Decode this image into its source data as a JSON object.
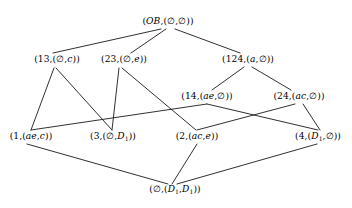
{
  "diagram": {
    "background_color": "#ffffff",
    "edge_color": "#1a1a1a",
    "text_color": "#000000",
    "width": 352,
    "height": 208,
    "nodes": [
      {
        "id": "OB",
        "label": "(OB,(∅,∅))",
        "x": 168,
        "y": 22,
        "level": 0
      },
      {
        "id": "13",
        "label": "(13,(∅,c))",
        "x": 57,
        "y": 60,
        "level": 1
      },
      {
        "id": "23",
        "label": "(23,(∅,e))",
        "x": 124,
        "y": 60,
        "level": 1
      },
      {
        "id": "124",
        "label": "(124,(a,∅))",
        "x": 248,
        "y": 60,
        "level": 1
      },
      {
        "id": "14",
        "label": "(14,(ae,∅))",
        "x": 207,
        "y": 97,
        "level": 2
      },
      {
        "id": "24",
        "label": "(24,(ac,∅))",
        "x": 299,
        "y": 97,
        "level": 2
      },
      {
        "id": "1",
        "label": "(1,(ae,c))",
        "x": 31,
        "y": 137,
        "level": 3
      },
      {
        "id": "3",
        "label": "(3,(∅,D₁))",
        "x": 113,
        "y": 137,
        "level": 3
      },
      {
        "id": "2",
        "label": "(2,(ac,e))",
        "x": 197,
        "y": 137,
        "level": 3
      },
      {
        "id": "4",
        "label": "(4,(D₁,∅))",
        "x": 318,
        "y": 137,
        "level": 3
      },
      {
        "id": "BOT",
        "label": "(∅,(D₁,D₁))",
        "x": 175,
        "y": 190,
        "level": 4
      }
    ],
    "edges": [
      {
        "from": "OB",
        "to": "13",
        "x1": 161,
        "y1": 29,
        "x2": 53,
        "y2": 53
      },
      {
        "from": "OB",
        "to": "23",
        "x1": 166,
        "y1": 29,
        "x2": 131,
        "y2": 53
      },
      {
        "from": "OB",
        "to": "124",
        "x1": 175,
        "y1": 29,
        "x2": 240,
        "y2": 53
      },
      {
        "from": "124",
        "to": "14",
        "x1": 244,
        "y1": 67,
        "x2": 212,
        "y2": 90
      },
      {
        "from": "124",
        "to": "24",
        "x1": 252,
        "y1": 67,
        "x2": 291,
        "y2": 90
      },
      {
        "from": "13",
        "to": "1",
        "x1": 54,
        "y1": 68,
        "x2": 31,
        "y2": 130
      },
      {
        "from": "13",
        "to": "3",
        "x1": 56,
        "y1": 68,
        "x2": 112,
        "y2": 130
      },
      {
        "from": "23",
        "to": "3",
        "x1": 119,
        "y1": 68,
        "x2": 112,
        "y2": 130
      },
      {
        "from": "23",
        "to": "2",
        "x1": 122,
        "y1": 68,
        "x2": 196,
        "y2": 130
      },
      {
        "from": "1",
        "to": "14",
        "x1": 31,
        "y1": 130,
        "x2": 207,
        "y2": 104
      },
      {
        "from": "14",
        "to": "4",
        "x1": 207,
        "y1": 104,
        "x2": 318,
        "y2": 130
      },
      {
        "from": "24",
        "to": "4",
        "x1": 303,
        "y1": 104,
        "x2": 320,
        "y2": 130
      },
      {
        "from": "24",
        "to": "2",
        "x1": 295,
        "y1": 104,
        "x2": 197,
        "y2": 130
      },
      {
        "from": "1",
        "to": "BOT",
        "x1": 27,
        "y1": 144,
        "x2": 168,
        "y2": 184
      },
      {
        "from": "2",
        "to": "BOT",
        "x1": 197,
        "y1": 144,
        "x2": 172,
        "y2": 184
      },
      {
        "from": "4",
        "to": "BOT",
        "x1": 317,
        "y1": 144,
        "x2": 177,
        "y2": 184
      }
    ]
  }
}
